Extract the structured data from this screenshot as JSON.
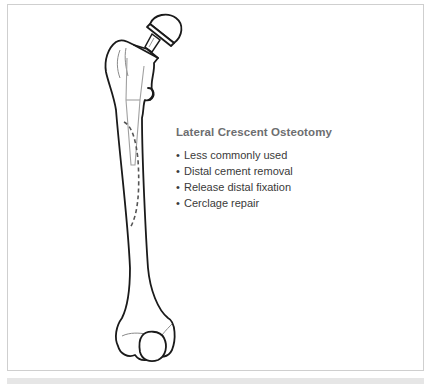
{
  "figure": {
    "title": "Lateral Crescent Osteotomy",
    "bullets": [
      "Less commonly used",
      "Distal cement removal",
      "Release distal fixation",
      "Cerclage repair"
    ],
    "bullet_glyph": "•",
    "colors": {
      "outline": "#1a1a1a",
      "stem": "#a0a0a0",
      "osteotomy_dash": "#555555",
      "title_text": "#6d6e70",
      "body_text": "#3a3a3a",
      "frame_border": "#cfcfcf"
    }
  }
}
